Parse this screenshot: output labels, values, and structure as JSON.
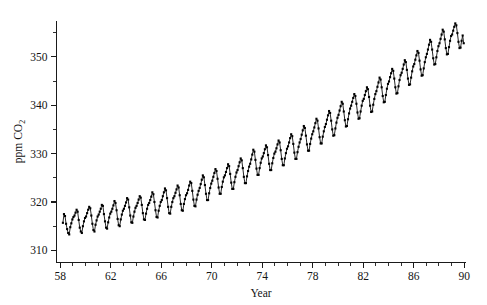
{
  "figure": {
    "background_color": "#ffffff",
    "foreground_color": "#141414",
    "width": 487,
    "height": 305
  },
  "axes": {
    "x_title": "Year",
    "y_title_main": "ppm CO",
    "y_title_sub": "2",
    "x_tick_labels": [
      "58",
      "62",
      "66",
      "70",
      "74",
      "78",
      "82",
      "86",
      "90"
    ],
    "y_tick_labels": [
      "310",
      "320",
      "330",
      "340",
      "350"
    ]
  },
  "chart_data": {
    "type": "line",
    "title": "",
    "subtitle": "",
    "xlabel": "Year",
    "ylabel": "ppm CO2",
    "grid": false,
    "legend": null,
    "legend_position": "none",
    "marker": "filled-square",
    "xlim": [
      57.7,
      90.1
    ],
    "ylim": [
      307.5,
      357.5
    ],
    "x_major_ticks": [
      58,
      62,
      66,
      70,
      74,
      78,
      82,
      86,
      90
    ],
    "x_minor_ticks": [
      59,
      60,
      61,
      63,
      64,
      65,
      67,
      68,
      69,
      71,
      72,
      73,
      75,
      76,
      77,
      79,
      80,
      81,
      83,
      84,
      85,
      87,
      88,
      89
    ],
    "y_major_ticks": [
      310,
      320,
      330,
      340,
      350
    ],
    "y_minor_ticks": [
      315,
      325,
      335,
      345,
      355
    ],
    "x_units": "calendar year (two-digit, 19xx)",
    "y_units": "parts per million by volume",
    "series": [
      {
        "name": "Mauna Loa monthly mean CO2",
        "x": [
          58.208,
          58.292,
          58.375,
          58.458,
          58.542,
          58.625,
          58.708,
          58.792,
          58.875,
          58.958,
          59.042,
          59.125,
          59.208,
          59.292,
          59.375,
          59.458,
          59.542,
          59.625,
          59.708,
          59.792,
          59.875,
          59.958,
          60.042,
          60.125,
          60.208,
          60.292,
          60.375,
          60.458,
          60.542,
          60.625,
          60.708,
          60.792,
          60.875,
          60.958,
          61.042,
          61.125,
          61.208,
          61.292,
          61.375,
          61.458,
          61.542,
          61.625,
          61.708,
          61.792,
          61.875,
          61.958,
          62.042,
          62.125,
          62.208,
          62.292,
          62.375,
          62.458,
          62.542,
          62.625,
          62.708,
          62.792,
          62.875,
          62.958,
          63.042,
          63.125,
          63.208,
          63.292,
          63.375,
          63.458,
          63.542,
          63.625,
          63.708,
          63.792,
          63.875,
          63.958,
          64.042,
          64.125,
          64.208,
          64.292,
          64.375,
          64.458,
          64.542,
          64.625,
          64.708,
          64.792,
          64.875,
          64.958,
          65.042,
          65.125,
          65.208,
          65.292,
          65.375,
          65.458,
          65.542,
          65.625,
          65.708,
          65.792,
          65.875,
          65.958,
          66.042,
          66.125,
          66.208,
          66.292,
          66.375,
          66.458,
          66.542,
          66.625,
          66.708,
          66.792,
          66.875,
          66.958,
          67.042,
          67.125,
          67.208,
          67.292,
          67.375,
          67.458,
          67.542,
          67.625,
          67.708,
          67.792,
          67.875,
          67.958,
          68.042,
          68.125,
          68.208,
          68.292,
          68.375,
          68.458,
          68.542,
          68.625,
          68.708,
          68.792,
          68.875,
          68.958,
          69.042,
          69.125,
          69.208,
          69.292,
          69.375,
          69.458,
          69.542,
          69.625,
          69.708,
          69.792,
          69.875,
          69.958,
          70.042,
          70.125,
          70.208,
          70.292,
          70.375,
          70.458,
          70.542,
          70.625,
          70.708,
          70.792,
          70.875,
          70.958,
          71.042,
          71.125,
          71.208,
          71.292,
          71.375,
          71.458,
          71.542,
          71.625,
          71.708,
          71.792,
          71.875,
          71.958,
          72.042,
          72.125,
          72.208,
          72.292,
          72.375,
          72.458,
          72.542,
          72.625,
          72.708,
          72.792,
          72.875,
          72.958,
          73.042,
          73.125,
          73.208,
          73.292,
          73.375,
          73.458,
          73.542,
          73.625,
          73.708,
          73.792,
          73.875,
          73.958,
          74.042,
          74.125,
          74.208,
          74.292,
          74.375,
          74.458,
          74.542,
          74.625,
          74.708,
          74.792,
          74.875,
          74.958,
          75.042,
          75.125,
          75.208,
          75.292,
          75.375,
          75.458,
          75.542,
          75.625,
          75.708,
          75.792,
          75.875,
          75.958,
          76.042,
          76.125,
          76.208,
          76.292,
          76.375,
          76.458,
          76.542,
          76.625,
          76.708,
          76.792,
          76.875,
          76.958,
          77.042,
          77.125,
          77.208,
          77.292,
          77.375,
          77.458,
          77.542,
          77.625,
          77.708,
          77.792,
          77.875,
          77.958,
          78.042,
          78.125,
          78.208,
          78.292,
          78.375,
          78.458,
          78.542,
          78.625,
          78.708,
          78.792,
          78.875,
          78.958,
          79.042,
          79.125,
          79.208,
          79.292,
          79.375,
          79.458,
          79.542,
          79.625,
          79.708,
          79.792,
          79.875,
          79.958,
          80.042,
          80.125,
          80.208,
          80.292,
          80.375,
          80.458,
          80.542,
          80.625,
          80.708,
          80.792,
          80.875,
          80.958,
          81.042,
          81.125,
          81.208,
          81.292,
          81.375,
          81.458,
          81.542,
          81.625,
          81.708,
          81.792,
          81.875,
          81.958,
          82.042,
          82.125,
          82.208,
          82.292,
          82.375,
          82.458,
          82.542,
          82.625,
          82.708,
          82.792,
          82.875,
          82.958,
          83.042,
          83.125,
          83.208,
          83.292,
          83.375,
          83.458,
          83.542,
          83.625,
          83.708,
          83.792,
          83.875,
          83.958,
          84.042,
          84.125,
          84.208,
          84.292,
          84.375,
          84.458,
          84.542,
          84.625,
          84.708,
          84.792,
          84.875,
          84.958,
          85.042,
          85.125,
          85.208,
          85.292,
          85.375,
          85.458,
          85.542,
          85.625,
          85.708,
          85.792,
          85.875,
          85.958,
          86.042,
          86.125,
          86.208,
          86.292,
          86.375,
          86.458,
          86.542,
          86.625,
          86.708,
          86.792,
          86.875,
          86.958,
          87.042,
          87.125,
          87.208,
          87.292,
          87.375,
          87.458,
          87.542,
          87.625,
          87.708,
          87.792,
          87.875,
          87.958,
          88.042,
          88.125,
          88.208,
          88.292,
          88.375,
          88.458,
          88.542,
          88.625,
          88.708,
          88.792,
          88.875,
          88.958,
          89.042,
          89.125,
          89.208,
          89.292,
          89.375,
          89.458,
          89.542,
          89.625,
          89.708,
          89.792,
          89.875,
          89.958
        ],
        "values": [
          315.7,
          317.5,
          317.1,
          315.5,
          314.4,
          313.6,
          313.3,
          314.8,
          315.6,
          316.4,
          316.9,
          317.2,
          317.8,
          318.4,
          318.0,
          316.3,
          314.7,
          313.9,
          313.6,
          315.0,
          316.0,
          316.7,
          317.0,
          317.7,
          318.4,
          319.0,
          318.7,
          317.2,
          315.5,
          314.2,
          313.9,
          315.3,
          316.2,
          317.0,
          317.4,
          318.0,
          318.6,
          319.4,
          319.2,
          317.5,
          316.0,
          314.7,
          314.5,
          315.8,
          316.8,
          317.6,
          318.0,
          318.6,
          319.3,
          320.2,
          319.8,
          318.3,
          316.5,
          315.2,
          315.0,
          316.4,
          317.4,
          318.2,
          318.6,
          319.2,
          319.9,
          320.8,
          320.5,
          318.9,
          317.2,
          315.8,
          315.7,
          317.0,
          318.0,
          318.8,
          319.2,
          319.8,
          320.5,
          321.2,
          320.9,
          319.4,
          317.7,
          316.4,
          316.3,
          317.6,
          318.6,
          319.4,
          319.8,
          320.4,
          321.1,
          322.0,
          321.6,
          320.0,
          318.3,
          316.9,
          316.8,
          318.2,
          319.2,
          320.0,
          320.4,
          321.2,
          322.0,
          322.8,
          322.4,
          320.8,
          319.0,
          317.7,
          317.6,
          319.0,
          320.0,
          320.8,
          321.2,
          321.9,
          322.6,
          323.4,
          323.0,
          321.4,
          319.6,
          318.3,
          318.2,
          319.6,
          320.6,
          321.4,
          321.8,
          322.5,
          323.4,
          324.2,
          323.9,
          322.3,
          320.5,
          319.2,
          319.1,
          320.5,
          321.5,
          322.3,
          322.9,
          323.7,
          324.6,
          325.5,
          325.1,
          323.5,
          321.7,
          320.4,
          320.4,
          321.8,
          322.9,
          323.8,
          324.4,
          325.2,
          326.0,
          326.8,
          326.4,
          324.8,
          323.0,
          321.7,
          321.7,
          323.1,
          324.2,
          325.1,
          325.5,
          326.2,
          327.0,
          327.8,
          327.4,
          325.8,
          324.0,
          322.7,
          322.7,
          324.1,
          325.2,
          326.1,
          326.6,
          327.4,
          328.2,
          329.0,
          328.6,
          327.0,
          325.2,
          323.9,
          323.9,
          325.3,
          326.4,
          327.3,
          327.9,
          328.8,
          329.8,
          330.8,
          330.4,
          328.7,
          326.9,
          325.6,
          325.6,
          327.0,
          328.1,
          329.0,
          329.4,
          330.1,
          330.9,
          331.7,
          331.3,
          329.7,
          327.9,
          326.6,
          326.6,
          328.0,
          329.1,
          330.0,
          330.4,
          331.1,
          331.9,
          332.7,
          332.3,
          330.7,
          328.9,
          327.6,
          327.6,
          329.0,
          330.1,
          331.0,
          331.5,
          332.3,
          333.2,
          334.0,
          333.6,
          332.0,
          330.2,
          328.9,
          328.9,
          330.3,
          331.4,
          332.3,
          333.0,
          333.9,
          334.8,
          335.7,
          335.3,
          333.7,
          331.9,
          330.6,
          330.6,
          332.0,
          333.1,
          334.0,
          334.6,
          335.4,
          336.3,
          337.2,
          336.8,
          335.2,
          333.4,
          332.1,
          332.1,
          333.5,
          334.6,
          335.5,
          336.1,
          337.0,
          337.9,
          338.8,
          338.4,
          336.8,
          335.0,
          333.7,
          333.8,
          335.2,
          336.4,
          337.4,
          338.0,
          338.9,
          339.8,
          340.7,
          340.3,
          338.7,
          336.9,
          335.6,
          335.7,
          337.1,
          338.3,
          339.3,
          339.9,
          340.7,
          341.5,
          342.3,
          341.9,
          340.3,
          338.5,
          337.2,
          337.3,
          338.7,
          339.9,
          340.9,
          341.3,
          342.1,
          342.9,
          343.7,
          343.3,
          341.7,
          339.9,
          338.6,
          338.7,
          340.1,
          341.3,
          342.3,
          342.9,
          343.8,
          344.7,
          345.7,
          345.3,
          343.7,
          341.9,
          340.6,
          340.7,
          342.1,
          343.4,
          344.4,
          344.9,
          345.8,
          346.6,
          347.5,
          347.1,
          345.5,
          343.7,
          342.4,
          342.5,
          343.9,
          345.2,
          346.2,
          346.7,
          347.5,
          348.4,
          349.3,
          348.9,
          347.3,
          345.5,
          344.2,
          344.3,
          345.7,
          347.0,
          348.0,
          348.5,
          349.4,
          350.3,
          351.2,
          350.8,
          349.2,
          347.4,
          346.1,
          346.2,
          347.6,
          348.9,
          349.9,
          350.6,
          351.5,
          352.5,
          353.5,
          353.1,
          351.5,
          349.7,
          348.4,
          348.5,
          349.9,
          351.2,
          352.2,
          352.8,
          353.7,
          354.6,
          355.6,
          355.2,
          353.6,
          351.8,
          350.5,
          350.6,
          352.0,
          353.3,
          354.3,
          354.6,
          355.4,
          356.2,
          356.9,
          356.5,
          354.9,
          353.1,
          351.8,
          351.9,
          353.3,
          354.4,
          352.8
        ]
      }
    ]
  }
}
